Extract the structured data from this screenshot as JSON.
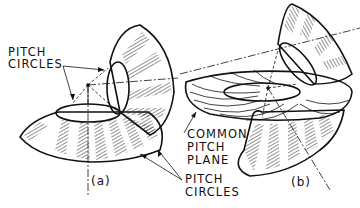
{
  "figure": {
    "subfigures": [
      {
        "id": "a",
        "label": "(a)"
      },
      {
        "id": "b",
        "label": "(b)"
      }
    ],
    "labels": {
      "pitch_circles_top_line1": "PITCH",
      "pitch_circles_top_line2": "CIRCLES",
      "pitch_circles_bottom_line1": "PITCH",
      "pitch_circles_bottom_line2": "CIRCLES",
      "common_pitch_plane_line1": "COMMON",
      "common_pitch_plane_line2": "PITCH",
      "common_pitch_plane_line3": "PLANE"
    },
    "colors": {
      "ink": "#111111",
      "background": "#ffffff"
    }
  }
}
